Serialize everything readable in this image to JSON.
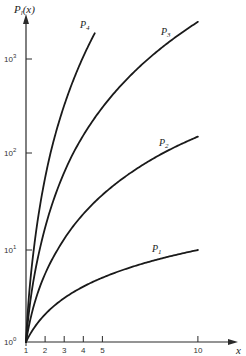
{
  "chart_data": {
    "type": "line",
    "title": "",
    "ylabel": "P",
    "ylabel_sub": "l",
    "ylabel_arg": "(x)",
    "xlabel": "x",
    "yscale": "log",
    "xscale": "linear",
    "xlim": [
      1,
      10.8
    ],
    "ylim": [
      1,
      4000
    ],
    "grid": false,
    "x_ticks": [
      {
        "value": 1,
        "label": "1"
      },
      {
        "value": 2,
        "label": "2"
      },
      {
        "value": 3,
        "label": "3"
      },
      {
        "value": 4,
        "label": "4"
      },
      {
        "value": 5,
        "label": "5"
      },
      {
        "value": 10,
        "label": "10"
      }
    ],
    "y_ticks": [
      {
        "value": 1,
        "base": "10",
        "exp": "0"
      },
      {
        "value": 10,
        "base": "10",
        "exp": "1"
      },
      {
        "value": 100,
        "base": "10",
        "exp": "2"
      },
      {
        "value": 1000,
        "base": "10",
        "exp": "3"
      }
    ],
    "series": [
      {
        "name": "P1",
        "label_base": "P",
        "label_sub": "1",
        "order": 1,
        "x_max": 10,
        "x": [
          1,
          2,
          3,
          4,
          5,
          6,
          7,
          8,
          9,
          10
        ],
        "values": [
          1,
          2,
          3,
          4,
          5,
          6,
          7,
          8,
          9,
          10
        ]
      },
      {
        "name": "P2",
        "label_base": "P",
        "label_sub": "2",
        "order": 2,
        "x_max": 10,
        "x": [
          1,
          2,
          3,
          4,
          5,
          6,
          7,
          8,
          9,
          10
        ],
        "values": [
          1,
          5.5,
          13,
          23.5,
          37,
          53.5,
          73,
          95.5,
          121,
          149.5
        ]
      },
      {
        "name": "P3",
        "label_base": "P",
        "label_sub": "3",
        "order": 3,
        "x_max": 10,
        "x": [
          1,
          2,
          3,
          4,
          5,
          6,
          7,
          8,
          9,
          10
        ],
        "values": [
          1,
          17,
          63,
          154,
          305,
          531,
          847,
          1268,
          1809,
          2485
        ]
      },
      {
        "name": "P4",
        "label_base": "P",
        "label_sub": "4",
        "order": 4,
        "x_max": 4.6,
        "x": [
          1,
          2,
          3,
          4,
          4.6
        ],
        "values": [
          1,
          55.4,
          321,
          1060,
          1862
        ]
      }
    ]
  }
}
